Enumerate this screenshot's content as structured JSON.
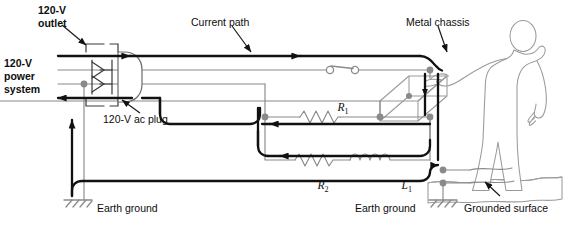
{
  "figure": {
    "colors": {
      "current_path": "#111111",
      "wire": "#8a8a8a",
      "object_outline": "#9a9a9a",
      "node_dot": "#8a8a8a",
      "label_text": "#0d0d0d",
      "background": "#ffffff"
    }
  },
  "labels": {
    "outlet": "120-V\noutlet",
    "outlet_line1": "120-V",
    "outlet_line2": "outlet",
    "power_system_line1": "120-V",
    "power_system_line2": "power",
    "power_system_line3": "system",
    "ac_plug": "120-V ac plug",
    "current_path": "Current path",
    "metal_chassis": "Metal chassis",
    "earth_ground_left": "Earth ground",
    "earth_ground_right": "Earth ground",
    "grounded_surface": "Grounded surface"
  },
  "components": [
    {
      "id": "R1",
      "symbol": "R",
      "subscript": "1",
      "type": "resistor"
    },
    {
      "id": "R2",
      "symbol": "R",
      "subscript": "2",
      "type": "resistor"
    },
    {
      "id": "L1",
      "symbol": "L",
      "subscript": "1",
      "type": "inductor"
    }
  ],
  "component_labels": {
    "r1_symbol": "R",
    "r1_sub": "1",
    "r2_symbol": "R",
    "r2_sub": "2",
    "l1_symbol": "L",
    "l1_sub": "1"
  },
  "elements": {
    "switch_state": "open",
    "person": "standing person touching metal chassis",
    "ground_symbols": 3
  }
}
